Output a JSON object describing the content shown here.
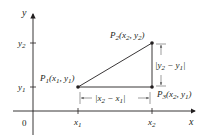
{
  "diagram": {
    "type": "coordinate-distance-diagram",
    "axes": {
      "x_label": "x",
      "y_label": "y",
      "origin_label": "0"
    },
    "ticks": {
      "x": [
        {
          "base": "x",
          "sub": "1"
        },
        {
          "base": "x",
          "sub": "2"
        }
      ],
      "y": [
        {
          "base": "y",
          "sub": "1"
        },
        {
          "base": "y",
          "sub": "2"
        }
      ]
    },
    "points": [
      {
        "name": "P",
        "sub": "1",
        "coords": "(x1, y1)",
        "x_sub": "1",
        "y_sub": "1"
      },
      {
        "name": "P",
        "sub": "2",
        "coords": "(x2, y2)",
        "x_sub": "2",
        "y_sub": "2"
      },
      {
        "name": "P",
        "sub": "3",
        "coords": "(x2, y1)",
        "x_sub": "2",
        "y_sub": "1"
      }
    ],
    "measurements": {
      "horizontal": {
        "text": "|x2 − x1|",
        "a": "2",
        "b": "1"
      },
      "vertical": {
        "text": "|y2 − y1|",
        "a": "2",
        "b": "1"
      }
    },
    "colors": {
      "ink": "#231f20",
      "guide": "#5a5a5a",
      "background": "#ffffff"
    }
  }
}
